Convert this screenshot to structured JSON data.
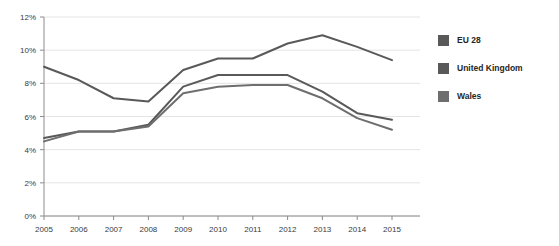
{
  "chart_data": {
    "type": "line",
    "title": "",
    "subtitle": "",
    "xlabel": "",
    "ylabel": "",
    "categories": [
      "2005",
      "2006",
      "2007",
      "2008",
      "2009",
      "2010",
      "2011",
      "2012",
      "2013",
      "2014",
      "2015"
    ],
    "x": [
      2005,
      2006,
      2007,
      2008,
      2009,
      2010,
      2011,
      2012,
      2013,
      2014,
      2015
    ],
    "ylim": [
      0,
      12
    ],
    "xlim": [
      2005,
      2015
    ],
    "y_ticks": [
      0,
      2,
      4,
      6,
      8,
      10,
      12
    ],
    "y_tick_labels": [
      "0%",
      "2%",
      "4%",
      "6%",
      "8%",
      "10%",
      "12%"
    ],
    "x_tick_labels": [
      "2005",
      "2006",
      "2007",
      "2008",
      "2009",
      "2010",
      "2011",
      "2012",
      "2013",
      "2014",
      "2015"
    ],
    "grid": true,
    "grid_axis": "y",
    "legend_position": "right",
    "series": [
      {
        "name": "EU 28",
        "color": "#595959",
        "values": [
          9.0,
          8.2,
          7.1,
          6.9,
          8.8,
          9.5,
          9.5,
          10.4,
          10.9,
          10.2,
          9.4
        ]
      },
      {
        "name": "United Kingdom",
        "color": "#595959",
        "values": [
          4.7,
          5.1,
          5.1,
          5.5,
          7.8,
          8.5,
          8.5,
          8.5,
          7.5,
          6.2,
          5.8
        ]
      },
      {
        "name": "Wales",
        "color": "#6e6e6e",
        "values": [
          4.5,
          5.1,
          5.1,
          5.4,
          7.4,
          7.8,
          7.9,
          7.9,
          7.1,
          5.9,
          5.2
        ]
      }
    ]
  },
  "legend": {
    "items": [
      {
        "label": "EU 28",
        "color": "#595959"
      },
      {
        "label": "United Kingdom",
        "color": "#595959"
      },
      {
        "label": "Wales",
        "color": "#6e6e6e"
      }
    ]
  },
  "axes": {
    "y_tick_labels": [
      "12%",
      "10%",
      "8%",
      "6%",
      "4%",
      "2%",
      "0%"
    ],
    "x_tick_labels": [
      "2005",
      "2006",
      "2007",
      "2008",
      "2009",
      "2010",
      "2011",
      "2012",
      "2013",
      "2014",
      "2015"
    ]
  },
  "colors": {
    "gridline": "#e4e4e4",
    "axis": "#8c8c8c",
    "text": "#3a3a3a",
    "line_primary": "#595959",
    "line_secondary": "#6e6e6e",
    "background": "#ffffff"
  }
}
